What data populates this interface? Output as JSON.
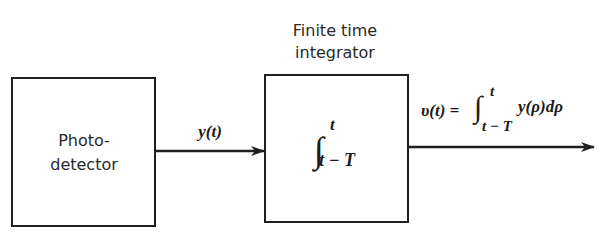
{
  "diagram": {
    "blocks": [
      {
        "id": "photodetector",
        "label_lines": [
          "Photo-",
          "detector"
        ]
      },
      {
        "id": "integrator",
        "title_lines": [
          "Finite time",
          "integrator"
        ],
        "integral_symbol": "∫",
        "upper_limit": "t",
        "lower_limit": "t − T"
      }
    ],
    "signals": [
      {
        "id": "input",
        "label": "y(t)"
      },
      {
        "id": "output",
        "lhs": "υ(t) =",
        "integral_symbol": "∫",
        "upper_limit": "t",
        "lower_limit": "t − T",
        "integrand": "y(ρ)dρ"
      }
    ],
    "colors": {
      "stroke": "#1f1f1f",
      "background": "#ffffff"
    }
  }
}
